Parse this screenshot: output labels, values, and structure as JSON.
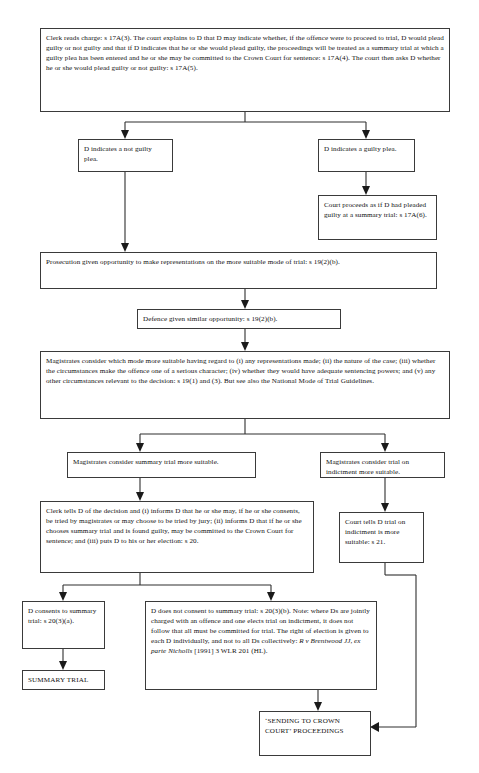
{
  "diagram": {
    "nodes": {
      "clerk_reads_charge": "Clerk reads charge: s 17A(3). The court explains to D that D may indicate whether, if the offence were to proceed to trial, D would plead guilty or not guilty and that if D indicates that he or she would plead guilty, the proceedings will be treated as a summary trial at which a guilty plea has been entered and he or she may be committed to the Crown Court for sentence: s 17A(4). The court then asks D whether he or she would plead guilty or not guilty: s 17A(5).",
      "not_guilty_plea": "D indicates a not guilty plea.",
      "guilty_plea": "D indicates a guilty plea.",
      "court_proceeds_guilty": "Court proceeds as if D had pleaded guilty at a summary trial: s 17A(6).",
      "prosecution_representations": "Prosecution given opportunity to make representations on the more suitable mode of trial: s 19(2)(b).",
      "defence_opportunity": "Defence given similar opportunity: s 19(2)(b).",
      "magistrates_consider_mode": "Magistrates consider which mode more suitable having regard to (i) any representations made; (ii) the nature of the case; (iii) whether the circumstances make the offence one of a serious character; (iv) whether they would have adequate sentencing powers; and (v) any other circumstances relevant to the decision: s 19(1) and (3). But see also the National Mode of Trial Guidelines.",
      "summary_more_suitable": "Magistrates consider summary trial more suitable.",
      "indictment_more_suitable": "Magistrates consider trial on indictment more suitable.",
      "clerk_tells_d_decision": "Clerk tells D of the decision and (i) informs D that he or she may, if he or she consents, be tried by magistrates or may choose to be tried by jury; (ii) informs D that if he or she chooses summary trial and is found guilty, may be committed to the Crown Court for sentence; and (iii) puts D to his or her election: s 20.",
      "court_tells_d_indictment": "Court tells D trial on indictment is more suitable: s 21.",
      "d_consents_summary": "D consents to summary trial: s 20(3)(a).",
      "summary_trial": "SUMMARY TRIAL",
      "d_not_consent_lead": "D does not consent to summary trial: s 20(3)(b). Note: where Ds are jointly charged with an offence and one elects trial on indictment, it does not follow that all must be committed for trial. The right of election is given to each D individually, and not to all Ds collectively: ",
      "d_not_consent_citation": "R v Brentwood JJ, ex parte Nicholls",
      "d_not_consent_tail": " [1991] 3 WLR 201 (HL).",
      "sending_to_crown_court": "‘SENDING TO CROWN COURT’ PROCEEDINGS"
    },
    "colors": {
      "box_border": "#3a3a3a",
      "connector": "#2e2e2e",
      "text": "#111111",
      "background": "#ffffff"
    }
  }
}
